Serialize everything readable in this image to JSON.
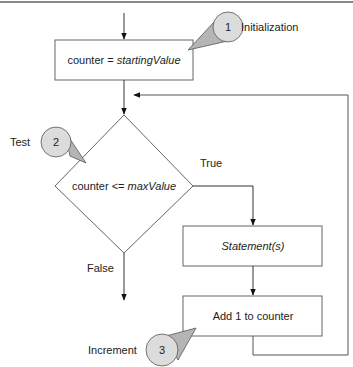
{
  "diagram": {
    "type": "flowchart",
    "nodes": {
      "init": {
        "text_plain": "counter = ",
        "text_italic": "startingValue"
      },
      "test": {
        "text_plain": "counter <= ",
        "text_italic": "maxValue"
      },
      "body": {
        "text_italic": "Statement(s)"
      },
      "increment": {
        "text_plain": "Add 1 to counter"
      }
    },
    "edges": {
      "true_label": "True",
      "false_label": "False"
    },
    "callouts": [
      {
        "number": "1",
        "label": "Initialization"
      },
      {
        "number": "2",
        "label": "Test"
      },
      {
        "number": "3",
        "label": "Increment"
      }
    ],
    "colors": {
      "line": "#333333",
      "box_border": "#666666",
      "callout_fill": "#dcdcdc",
      "callout_tail": "#b5b5b5",
      "callout_border": "#555555",
      "top_rule": "#888888"
    }
  }
}
